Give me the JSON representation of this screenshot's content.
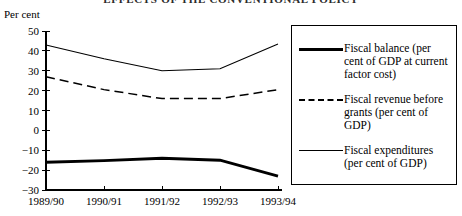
{
  "title": "EFFECTS OF THE CONVENTIONAL POLICY",
  "axis_unit_label": "Per cent",
  "legend": {
    "entries": [
      {
        "label": "Fiscal balance (per cent of GDP at current factor cost)",
        "style": "thick-solid"
      },
      {
        "label": "Fiscal revenue before grants (per cent of GDP)",
        "style": "dashed"
      },
      {
        "label": "Fiscal expenditures (per cent of GDP)",
        "style": "thin-solid"
      }
    ]
  },
  "chart_data": {
    "type": "line",
    "title": "EFFECTS OF THE CONVENTIONAL POLICY",
    "xlabel": "",
    "ylabel": "Per cent",
    "categories": [
      "1989/90",
      "1990/91",
      "1991/92",
      "1992/93",
      "1993/94"
    ],
    "ylim": [
      -30,
      50
    ],
    "ytick_labels": [
      "50",
      "40",
      "30",
      "20",
      "10",
      "0",
      "-10",
      "-20",
      "-30"
    ],
    "yticks": [
      50,
      40,
      30,
      20,
      10,
      0,
      -10,
      -20,
      -30
    ],
    "grid": false,
    "legend_position": "right",
    "series": [
      {
        "name": "Fiscal balance (per cent of GDP at current factor cost)",
        "style": "thick-solid",
        "values": [
          -16,
          -15.2,
          -14,
          -15,
          -23
        ]
      },
      {
        "name": "Fiscal revenue before grants (per cent of GDP)",
        "style": "dashed",
        "values": [
          27,
          20.5,
          16,
          16,
          20.5
        ]
      },
      {
        "name": "Fiscal expenditures (per cent of GDP)",
        "style": "thin-solid",
        "values": [
          43,
          36,
          30,
          31,
          43.5
        ]
      }
    ]
  }
}
